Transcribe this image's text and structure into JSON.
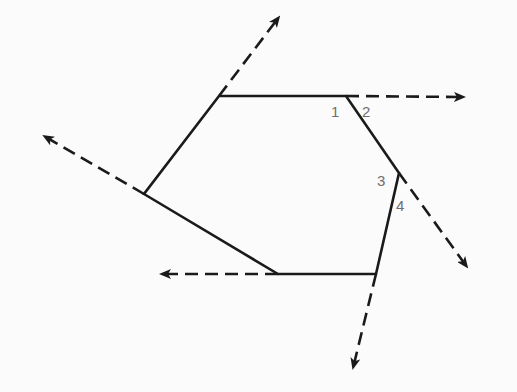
{
  "diagram": {
    "colors": {
      "background": "#fbfbfb",
      "stroke": "#1a1a1a",
      "label": "#6e6e6e"
    },
    "polygon": {
      "vertices": [
        [
          219,
          96
        ],
        [
          346,
          96
        ],
        [
          399,
          173
        ],
        [
          376,
          274
        ],
        [
          278,
          274
        ],
        [
          144,
          194
        ]
      ]
    },
    "rays": [
      {
        "name": "ray-top-right",
        "from": [
          346,
          96
        ],
        "to": [
          464,
          97
        ]
      },
      {
        "name": "ray-top",
        "from": [
          219,
          96
        ],
        "to": [
          279,
          17
        ]
      },
      {
        "name": "ray-upper-left",
        "from": [
          144,
          194
        ],
        "to": [
          44,
          136
        ]
      },
      {
        "name": "ray-bottom-left",
        "from": [
          278,
          274
        ],
        "to": [
          161,
          274
        ]
      },
      {
        "name": "ray-bottom",
        "from": [
          376,
          274
        ],
        "to": [
          353,
          368
        ]
      },
      {
        "name": "ray-lower-right",
        "from": [
          399,
          173
        ],
        "to": [
          467,
          267
        ]
      }
    ],
    "angle_labels": [
      {
        "text": "1",
        "x": 331,
        "y": 117
      },
      {
        "text": "2",
        "x": 362,
        "y": 117
      },
      {
        "text": "3",
        "x": 377,
        "y": 186
      },
      {
        "text": "4",
        "x": 396,
        "y": 211
      }
    ]
  }
}
